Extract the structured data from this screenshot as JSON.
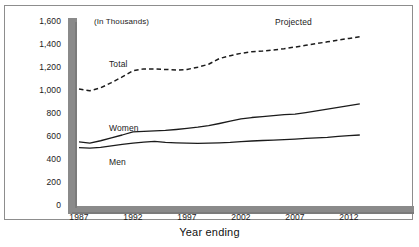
{
  "figure": {
    "clipped_caption_text": "",
    "units_note": "(In Thousands)",
    "x_axis_title": "Year ending",
    "projected_annotation": "Projected",
    "series_labels": {
      "total": "Total",
      "women": "Women",
      "men": "Men"
    },
    "colors": {
      "axis_bar": "#8a8a8a",
      "axis_bar_shadow": "#6f6f6f",
      "line": "#1b1b1b",
      "frame_border": "#8d8d8d",
      "background": "#ffffff",
      "text": "#1b1b1b"
    }
  },
  "chart_data": {
    "type": "line",
    "title": "",
    "subtitle": "(In Thousands)",
    "xlabel": "Year ending",
    "ylabel": "",
    "xlim": [
      1987,
      2013
    ],
    "ylim": [
      0,
      1600
    ],
    "ytick_labels": [
      "1,600",
      "1,400",
      "1,200",
      "1,000",
      "800",
      "600",
      "400",
      "200",
      "0"
    ],
    "ytick_values": [
      1600,
      1400,
      1200,
      1000,
      800,
      600,
      400,
      200,
      0
    ],
    "xtick_labels": [
      "1987",
      "1992",
      "1997",
      "2002",
      "2007",
      "2012"
    ],
    "xtick_values": [
      1987,
      1992,
      1997,
      2002,
      2007,
      2012
    ],
    "grid": false,
    "legend": "inline-labels",
    "annotations": [
      {
        "text": "Projected",
        "x": 2007,
        "y": 1560
      },
      {
        "text": "(In Thousands)",
        "x": 1988,
        "y": 1570
      }
    ],
    "x": [
      1987,
      1988,
      1989,
      1990,
      1991,
      1992,
      1993,
      1994,
      1995,
      1996,
      1997,
      1998,
      1999,
      2000,
      2001,
      2002,
      2003,
      2004,
      2005,
      2006,
      2007,
      2008,
      2009,
      2010,
      2011,
      2012,
      2013
    ],
    "series": [
      {
        "name": "Total",
        "style": "dashed",
        "values": [
          1000,
          985,
          1010,
          1055,
          1105,
          1160,
          1175,
          1175,
          1170,
          1165,
          1170,
          1190,
          1215,
          1265,
          1290,
          1310,
          1325,
          1330,
          1340,
          1350,
          1365,
          1380,
          1395,
          1410,
          1425,
          1440,
          1455
        ]
      },
      {
        "name": "Women",
        "style": "solid",
        "values": [
          540,
          530,
          550,
          575,
          600,
          628,
          632,
          635,
          640,
          648,
          658,
          668,
          682,
          700,
          720,
          740,
          752,
          760,
          768,
          778,
          782,
          795,
          810,
          825,
          840,
          855,
          870
        ]
      },
      {
        "name": "Men",
        "style": "solid",
        "values": [
          490,
          485,
          492,
          505,
          518,
          530,
          538,
          545,
          535,
          532,
          530,
          528,
          530,
          532,
          535,
          542,
          548,
          552,
          556,
          560,
          565,
          570,
          575,
          580,
          588,
          595,
          600
        ]
      }
    ]
  }
}
